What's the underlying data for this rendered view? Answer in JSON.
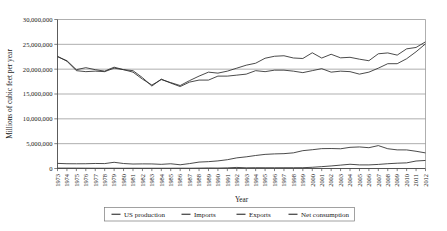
{
  "chart_data": {
    "type": "line",
    "title": "",
    "xlabel": "Year",
    "ylabel": "Millions of cubic feet per year",
    "grid": true,
    "legend_position": "bottom",
    "ylim": [
      0,
      30000000
    ],
    "yticks": [
      0,
      5000000,
      10000000,
      15000000,
      20000000,
      25000000,
      30000000
    ],
    "ytick_labels": [
      "0",
      "5,000,000",
      "10,000,000",
      "15,000,000",
      "20,000,000",
      "25,000,000",
      "30,000,000"
    ],
    "categories": [
      "1973",
      "1974",
      "1975",
      "1976",
      "1977",
      "1978",
      "1979",
      "1980",
      "1981",
      "1982",
      "1983",
      "1984",
      "1985",
      "1986",
      "1987",
      "1988",
      "1989",
      "1990",
      "1991",
      "1992",
      "1993",
      "1994",
      "1995",
      "1996",
      "1997",
      "1998",
      "1999",
      "2000",
      "2001",
      "2002",
      "2003",
      "2004",
      "2005",
      "2006",
      "2007",
      "2008",
      "2009",
      "2010",
      "2011",
      "2012"
    ],
    "series": [
      {
        "name": "US production",
        "values": [
          22600000,
          21600000,
          19700000,
          19500000,
          19600000,
          19500000,
          20200000,
          19900000,
          19700000,
          18300000,
          16600000,
          18000000,
          17200000,
          16500000,
          17400000,
          17800000,
          17800000,
          18600000,
          18600000,
          18800000,
          19000000,
          19700000,
          19500000,
          19800000,
          19800000,
          19600000,
          19300000,
          19700000,
          20100000,
          19400000,
          19600000,
          19500000,
          19000000,
          19400000,
          20200000,
          21100000,
          21100000,
          22100000,
          23500000,
          25100000
        ]
      },
      {
        "name": "Imports",
        "values": [
          1030000,
          960000,
          950000,
          960000,
          1010000,
          990000,
          1250000,
          1000000,
          900000,
          930000,
          920000,
          840000,
          950000,
          750000,
          990000,
          1290000,
          1380000,
          1530000,
          1770000,
          2140000,
          2350000,
          2620000,
          2840000,
          2940000,
          2990000,
          3150000,
          3590000,
          3780000,
          4000000,
          4020000,
          3970000,
          4260000,
          4340000,
          4190000,
          4610000,
          3980000,
          3750000,
          3740000,
          3470000,
          3140000
        ]
      },
      {
        "name": "Exports",
        "values": [
          77000,
          76000,
          72000,
          64000,
          56000,
          52000,
          55000,
          49000,
          59000,
          52000,
          55000,
          55000,
          55000,
          60000,
          54000,
          74000,
          107000,
          86000,
          129000,
          216000,
          140000,
          162000,
          154000,
          153000,
          157000,
          159000,
          163000,
          244000,
          373000,
          516000,
          680000,
          854000,
          724000,
          724000,
          823000,
          963000,
          1070000,
          1136000,
          1507000,
          1619000
        ]
      },
      {
        "name": "Net consumption",
        "values": [
          22500000,
          21700000,
          19900000,
          20300000,
          19900000,
          19600000,
          20400000,
          19900000,
          19400000,
          18000000,
          16800000,
          17900000,
          17300000,
          16700000,
          17700000,
          18600000,
          19400000,
          19200000,
          19600000,
          20200000,
          20800000,
          21200000,
          22200000,
          22600000,
          22700000,
          22250000,
          22150000,
          23300000,
          22240000,
          23000000,
          22280000,
          22390000,
          22010000,
          21700000,
          23100000,
          23270000,
          22830000,
          24090000,
          24370000,
          25500000
        ]
      }
    ]
  },
  "legend": {
    "items": [
      {
        "label": "US production"
      },
      {
        "label": "Imports"
      },
      {
        "label": "Exports"
      },
      {
        "label": "Net consumption"
      }
    ]
  }
}
